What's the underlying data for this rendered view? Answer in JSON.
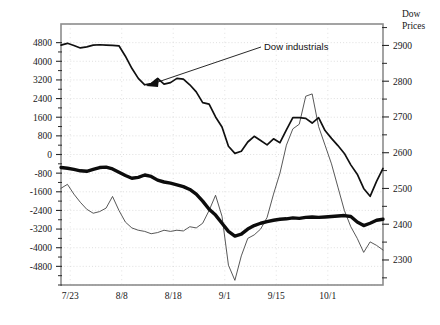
{
  "chart_data": {
    "type": "line",
    "title": "",
    "xlabel": "",
    "ylabel": "",
    "grid": true,
    "legend_position": "annotation",
    "right_axis_title_line1": "Dow",
    "right_axis_title_line2": "Prices",
    "annotations": [
      {
        "text": "Dow industrials",
        "points_to_series": "dow-industrials",
        "x_label": "8/8",
        "y_value": 2800
      }
    ],
    "x_axis": {
      "tick_labels": [
        "7/23",
        "8/8",
        "8/18",
        "9/1",
        "9/15",
        "10/1"
      ],
      "range_label": "7/23 - 10/1"
    },
    "left_axis": {
      "tick_labels": [
        "4800",
        "4000",
        "3200",
        "2400",
        "1600",
        "800",
        "0",
        "-800",
        "-1600",
        "-2400",
        "-3200",
        "-4000",
        "-4800"
      ],
      "values": [
        4800,
        4000,
        3200,
        2400,
        1600,
        800,
        0,
        -800,
        -1600,
        -2400,
        -3200,
        -4000,
        -4800
      ],
      "ylim": [
        -5600,
        5600
      ]
    },
    "right_axis": {
      "tick_labels": [
        "2900",
        "2800",
        "2700",
        "2600",
        "2500",
        "2400",
        "2300"
      ],
      "values": [
        2900,
        2800,
        2700,
        2600,
        2500,
        2400,
        2300
      ],
      "ylim": [
        2230,
        2960
      ]
    },
    "series": [
      {
        "name": "dow-industrials",
        "axis": "right",
        "style": "medium",
        "x": [
          0.0,
          0.02,
          0.04,
          0.06,
          0.08,
          0.1,
          0.12,
          0.14,
          0.16,
          0.18,
          0.2,
          0.22,
          0.24,
          0.26,
          0.28,
          0.3,
          0.32,
          0.34,
          0.36,
          0.38,
          0.4,
          0.42,
          0.44,
          0.46,
          0.48,
          0.5,
          0.52,
          0.54,
          0.56,
          0.58,
          0.6,
          0.62,
          0.64,
          0.66,
          0.68,
          0.7,
          0.72,
          0.74,
          0.76,
          0.78,
          0.8,
          0.82,
          0.84,
          0.86,
          0.88,
          0.9,
          0.92,
          0.94,
          0.96,
          0.98,
          1.0
        ],
        "values": [
          2901,
          2906,
          2900,
          2893,
          2896,
          2901,
          2902,
          2901,
          2900,
          2899,
          2870,
          2836,
          2808,
          2790,
          2793,
          2808,
          2792,
          2796,
          2808,
          2806,
          2790,
          2770,
          2740,
          2736,
          2700,
          2672,
          2618,
          2598,
          2604,
          2630,
          2646,
          2634,
          2622,
          2639,
          2628,
          2664,
          2698,
          2698,
          2696,
          2683,
          2698,
          2662,
          2640,
          2620,
          2598,
          2566,
          2540,
          2500,
          2478,
          2520,
          2556
        ]
      },
      {
        "name": "series-thick-black",
        "axis": "left",
        "style": "thick",
        "x": [
          0.0,
          0.02,
          0.04,
          0.06,
          0.08,
          0.1,
          0.12,
          0.14,
          0.16,
          0.18,
          0.2,
          0.22,
          0.24,
          0.26,
          0.28,
          0.3,
          0.32,
          0.34,
          0.36,
          0.38,
          0.4,
          0.42,
          0.44,
          0.46,
          0.48,
          0.5,
          0.52,
          0.54,
          0.56,
          0.58,
          0.6,
          0.62,
          0.64,
          0.66,
          0.68,
          0.7,
          0.72,
          0.74,
          0.76,
          0.78,
          0.8,
          0.82,
          0.84,
          0.86,
          0.88,
          0.9,
          0.92,
          0.94,
          0.96,
          0.98,
          1.0
        ],
        "values": [
          -560,
          -590,
          -640,
          -700,
          -720,
          -640,
          -560,
          -540,
          -620,
          -760,
          -900,
          -1020,
          -980,
          -880,
          -940,
          -1100,
          -1180,
          -1230,
          -1300,
          -1380,
          -1500,
          -1700,
          -2000,
          -2350,
          -2600,
          -2950,
          -3300,
          -3500,
          -3420,
          -3200,
          -3050,
          -2950,
          -2880,
          -2820,
          -2780,
          -2760,
          -2720,
          -2740,
          -2700,
          -2680,
          -2700,
          -2680,
          -2660,
          -2640,
          -2620,
          -2660,
          -2900,
          -3050,
          -2950,
          -2820,
          -2780
        ]
      },
      {
        "name": "series-thin-volatile",
        "axis": "left",
        "style": "thin",
        "x": [
          0.0,
          0.02,
          0.04,
          0.06,
          0.08,
          0.1,
          0.12,
          0.14,
          0.16,
          0.18,
          0.2,
          0.22,
          0.24,
          0.26,
          0.28,
          0.3,
          0.32,
          0.34,
          0.36,
          0.38,
          0.4,
          0.42,
          0.44,
          0.46,
          0.48,
          0.5,
          0.52,
          0.54,
          0.56,
          0.58,
          0.6,
          0.62,
          0.64,
          0.66,
          0.68,
          0.7,
          0.72,
          0.74,
          0.76,
          0.78,
          0.8,
          0.82,
          0.84,
          0.86,
          0.88,
          0.9,
          0.92,
          0.94,
          0.96,
          0.98,
          1.0
        ],
        "values": [
          -1450,
          -1280,
          -1700,
          -2050,
          -2350,
          -2520,
          -2450,
          -2300,
          -1800,
          -2400,
          -2900,
          -3150,
          -3250,
          -3300,
          -3400,
          -3350,
          -3250,
          -3300,
          -3250,
          -3280,
          -3100,
          -3150,
          -2950,
          -2400,
          -1750,
          -2650,
          -4750,
          -5400,
          -4350,
          -3600,
          -3450,
          -3200,
          -2700,
          -1700,
          -800,
          400,
          1100,
          1300,
          2500,
          2600,
          1200,
          400,
          -400,
          -1400,
          -2400,
          -3100,
          -3600,
          -4200,
          -3750,
          -3900,
          -4100
        ]
      }
    ]
  }
}
